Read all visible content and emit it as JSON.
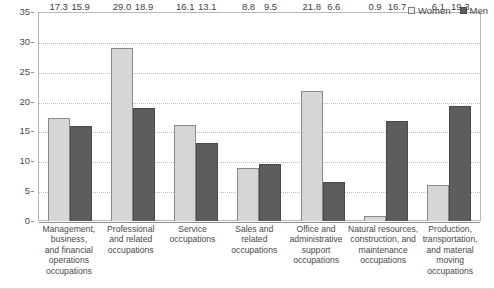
{
  "chart_data": {
    "type": "bar",
    "title": "",
    "subtitle": "",
    "xlabel": "",
    "ylabel": "",
    "ylim": [
      0,
      35
    ],
    "ytick_step": 5,
    "yticks": [
      "0",
      "5",
      "10",
      "15",
      "20",
      "25",
      "30",
      "35"
    ],
    "grid": true,
    "legend_position": "top-right",
    "categories": [
      "Management, business, and financial operations occupations",
      "Professional and related occupations",
      "Service occupations",
      "Sales and related occupations",
      "Office and administrative support occupations",
      "Natural resources, construction, and maintenance occupations",
      "Production, transportation, and material moving occupations"
    ],
    "category_lines": [
      [
        "Management,",
        "business,",
        "and financial",
        "operations",
        "occupations"
      ],
      [
        "Professional",
        "and related",
        "occupations"
      ],
      [
        "Service",
        "occupations"
      ],
      [
        "Sales and",
        "related",
        "occupations"
      ],
      [
        "Office and",
        "administrative",
        "support",
        "occupations"
      ],
      [
        "Natural resources,",
        "construction, and",
        "maintenance",
        "occupations"
      ],
      [
        "Production,",
        "transportation,",
        "and material",
        "moving",
        "occupations"
      ]
    ],
    "series": [
      {
        "name": "Women",
        "color": "#d6d6d6",
        "values": [
          17.3,
          29.0,
          16.1,
          8.8,
          21.8,
          0.9,
          6.1
        ],
        "labels": [
          "17.3",
          "29.0",
          "16.1",
          "8.8",
          "21.8",
          "0.9",
          "6.1"
        ]
      },
      {
        "name": "Men",
        "color": "#5d5d5d",
        "values": [
          15.9,
          18.9,
          13.1,
          9.5,
          6.6,
          16.7,
          19.3
        ],
        "labels": [
          "15.9",
          "18.9",
          "13.1",
          "9.5",
          "6.6",
          "16.7",
          "19.3"
        ]
      }
    ]
  },
  "legend": {
    "items": [
      {
        "label": "Women",
        "swatch": "women"
      },
      {
        "label": "Men",
        "swatch": "men"
      }
    ]
  }
}
